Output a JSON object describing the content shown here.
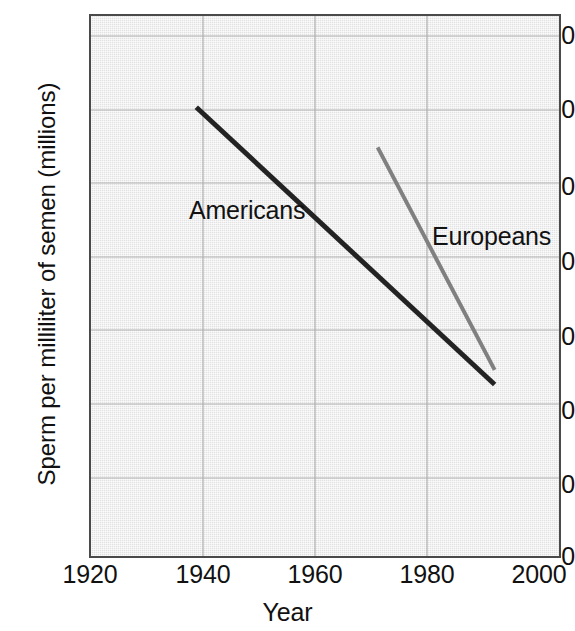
{
  "chart_data": {
    "type": "line",
    "title": "",
    "xlabel": "Year",
    "ylabel": "Sperm per milliliter of semen (millions)",
    "xlim": [
      1920,
      2000
    ],
    "ylim": [
      0,
      148
    ],
    "xticks": [
      1920,
      1940,
      1960,
      1980,
      2000
    ],
    "xtick_labels": [
      "1920",
      "1940",
      "1960",
      "1980",
      "2000"
    ],
    "yticks": [
      0,
      20,
      40,
      60,
      80,
      100,
      120,
      140
    ],
    "ytick_labels": [
      "0",
      "20",
      "40",
      "60",
      "80",
      "100",
      "120",
      "140"
    ],
    "grid": true,
    "legend_position": "inline-annotations",
    "series": [
      {
        "name": "Americans",
        "color": "#232323",
        "line_width": 5,
        "x": [
          1938,
          1989
        ],
        "values": [
          123,
          47
        ]
      },
      {
        "name": "Europeans",
        "color": "#808080",
        "line_width": 4,
        "x": [
          1969,
          1989
        ],
        "values": [
          112,
          51
        ]
      }
    ],
    "annotations": [
      {
        "text": "Americans",
        "x": 1938,
        "y": 95
      },
      {
        "text": "Europeans",
        "x": 1981,
        "y": 89
      }
    ]
  },
  "axis": {
    "y_title": "Sperm per milliliter of semen (millions)",
    "x_title": "Year"
  },
  "colors": {
    "plot_background": "#ebebeb",
    "axis_line": "#4a4a4a",
    "grid_line": "#b4b4b4",
    "americans_line": "#232323",
    "europeans_line": "#808080",
    "text": "#111111"
  }
}
